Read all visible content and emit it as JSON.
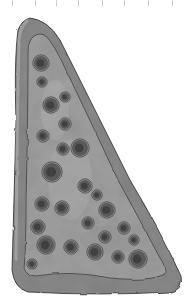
{
  "image": {
    "subject": "pizza slice illustration",
    "style": "grayscale watercolor sketch",
    "background": "#ffffff",
    "colors": {
      "crust": "#8a8a8a",
      "crust_light": "#a3a3a3",
      "cheese": "#9c9c9c",
      "cheese_light": "#b2b2b2",
      "pepperoni": "#5a5a5a",
      "pepperoni_dark": "#3a3a3a",
      "outline": "#2a2a2a",
      "tick": "#c8c8c8"
    },
    "ticks_x": [
      12,
      35,
      56,
      78,
      102,
      124,
      148,
      172
    ],
    "toppings": [
      {
        "cx": 41,
        "cy": 63,
        "r": 7
      },
      {
        "cx": 42,
        "cy": 82,
        "r": 4
      },
      {
        "cx": 51,
        "cy": 105,
        "r": 7
      },
      {
        "cx": 65,
        "cy": 97,
        "r": 4
      },
      {
        "cx": 65,
        "cy": 124,
        "r": 5
      },
      {
        "cx": 43,
        "cy": 136,
        "r": 5
      },
      {
        "cx": 63,
        "cy": 149,
        "r": 5
      },
      {
        "cx": 80,
        "cy": 148,
        "r": 8
      },
      {
        "cx": 52,
        "cy": 172,
        "r": 9
      },
      {
        "cx": 85,
        "cy": 186,
        "r": 6
      },
      {
        "cx": 97,
        "cy": 195,
        "r": 4
      },
      {
        "cx": 42,
        "cy": 204,
        "r": 6
      },
      {
        "cx": 62,
        "cy": 208,
        "r": 6
      },
      {
        "cx": 107,
        "cy": 210,
        "r": 7
      },
      {
        "cx": 88,
        "cy": 223,
        "r": 5
      },
      {
        "cx": 38,
        "cy": 227,
        "r": 6
      },
      {
        "cx": 124,
        "cy": 228,
        "r": 5
      },
      {
        "cx": 105,
        "cy": 237,
        "r": 5
      },
      {
        "cx": 46,
        "cy": 245,
        "r": 8
      },
      {
        "cx": 71,
        "cy": 247,
        "r": 6
      },
      {
        "cx": 134,
        "cy": 240,
        "r": 4
      },
      {
        "cx": 95,
        "cy": 252,
        "r": 7
      },
      {
        "cx": 118,
        "cy": 257,
        "r": 5
      },
      {
        "cx": 138,
        "cy": 259,
        "r": 8
      },
      {
        "cx": 32,
        "cy": 264,
        "r": 4
      }
    ]
  }
}
